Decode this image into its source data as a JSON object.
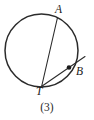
{
  "figure": {
    "caption": "(3)",
    "kind": "circle-with-tangent-and-chord",
    "stroke_color": "#2b2b2b",
    "background_color": "#ffffff",
    "labels": {
      "a": "A",
      "b": "B",
      "t": "T"
    }
  },
  "geometry": {
    "circle": {
      "center_x": 41.5,
      "center_y": 50.5,
      "radius": 36.5,
      "stroke_width": 1.5
    },
    "points": {
      "A": {
        "x": 57.5,
        "y": 17.5,
        "label": "A"
      },
      "B": {
        "x": 69.0,
        "y": 67.5,
        "label": "B",
        "dot_radius": 2.3
      },
      "T": {
        "x": 41.5,
        "y": 87.0,
        "label": "T"
      }
    },
    "segments": [
      {
        "name": "chord-AT",
        "x1": 57.5,
        "y1": 17.5,
        "x2": 41.5,
        "y2": 87.0,
        "stroke_width": 1.1
      },
      {
        "name": "secant-TB-extended",
        "x1": 40.0,
        "y1": 87.5,
        "x2": 85.0,
        "y2": 56.5,
        "stroke_width": 1.1
      }
    ]
  }
}
